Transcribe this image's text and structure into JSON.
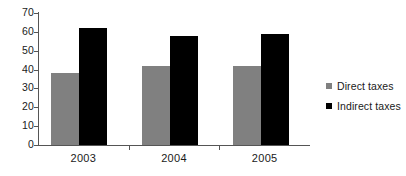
{
  "chart_data": {
    "type": "bar",
    "title": "",
    "subtitle": "",
    "xlabel": "",
    "ylabel": "",
    "categories": [
      "2003",
      "2004",
      "2005"
    ],
    "series": [
      {
        "name": "Direct taxes",
        "color": "#808080",
        "values": [
          38,
          42,
          42
        ]
      },
      {
        "name": "Indirect taxes",
        "color": "#000000",
        "values": [
          62,
          58,
          59
        ]
      }
    ],
    "ylim": [
      0,
      70
    ],
    "ytick_step": 10,
    "yticks": [
      70,
      60,
      50,
      40,
      30,
      20,
      10,
      0
    ],
    "ytick_labels": [
      "70",
      "60",
      "50",
      "40",
      "30",
      "20",
      "10",
      "0"
    ],
    "grid": false,
    "legend_position": "right",
    "annotations": []
  },
  "legend": {
    "entries": [
      {
        "label": "Direct taxes",
        "swatch": "gray-square-marker"
      },
      {
        "label": "Indirect taxes",
        "swatch": "black-square-marker"
      }
    ]
  }
}
